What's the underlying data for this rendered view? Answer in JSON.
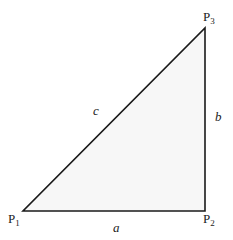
{
  "diagram": {
    "type": "right-triangle",
    "fill_color": "#f7f7f7",
    "stroke_color": "#1a1a1a",
    "vertices": [
      {
        "id": "P1",
        "base": "P",
        "sub": "1",
        "x": 23,
        "y": 211,
        "label_x": 8,
        "label_y": 223
      },
      {
        "id": "P2",
        "base": "P",
        "sub": "2",
        "x": 205,
        "y": 211,
        "label_x": 203,
        "label_y": 223
      },
      {
        "id": "P3",
        "base": "P",
        "sub": "3",
        "x": 205,
        "y": 28,
        "label_x": 203,
        "label_y": 21
      }
    ],
    "sides": [
      {
        "id": "a",
        "label": "a",
        "from": "P1",
        "to": "P2",
        "label_x": 113,
        "label_y": 232
      },
      {
        "id": "b",
        "label": "b",
        "from": "P2",
        "to": "P3",
        "label_x": 215,
        "label_y": 121
      },
      {
        "id": "c",
        "label": "c",
        "from": "P1",
        "to": "P3",
        "label_x": 93,
        "label_y": 115
      }
    ]
  }
}
